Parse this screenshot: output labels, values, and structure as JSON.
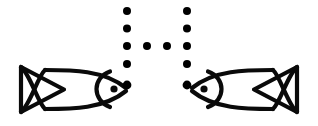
{
  "canvas": {
    "width": 318,
    "height": 126,
    "background_color": "#ffffff",
    "ink_color": "#000000"
  },
  "figure": {
    "stroke_color": "#0a0a0a",
    "stroke_width": 4
  },
  "fish": [
    {
      "name": "left-fish",
      "facing": "right",
      "mirrored": false,
      "tail_tip_x": 20,
      "nose_x": 126,
      "center_y": 88,
      "parts": [
        {
          "name": "tail",
          "shape": "triangle-with-crossing-lines"
        },
        {
          "name": "body",
          "shape": "lens"
        },
        {
          "name": "head",
          "shape": "circle-arc"
        },
        {
          "name": "eye",
          "shape": "filled-dot"
        }
      ]
    },
    {
      "name": "right-fish",
      "facing": "left",
      "mirrored": true,
      "tail_tip_x": 298,
      "nose_x": 192,
      "center_y": 88,
      "parts": [
        {
          "name": "tail",
          "shape": "triangle-with-crossing-lines"
        },
        {
          "name": "body",
          "shape": "lens"
        },
        {
          "name": "head",
          "shape": "circle-arc"
        },
        {
          "name": "eye",
          "shape": "filled-dot"
        }
      ]
    }
  ],
  "dot_pattern": {
    "name": "cross-dot-pattern",
    "shape": "cross",
    "dot_radius": 4,
    "dot_color": "#000000",
    "total_dots": 12,
    "columns": [
      {
        "name": "left-dot-column",
        "x": 127,
        "count": 5,
        "ys": [
          11,
          28.5,
          46,
          64,
          85
        ]
      },
      {
        "name": "right-dot-column",
        "x": 187,
        "count": 5,
        "ys": [
          11,
          28.5,
          46,
          64,
          85
        ]
      }
    ],
    "middle_row": {
      "name": "middle-dot-row",
      "y": 46,
      "count": 2,
      "xs": [
        147,
        167
      ]
    }
  }
}
